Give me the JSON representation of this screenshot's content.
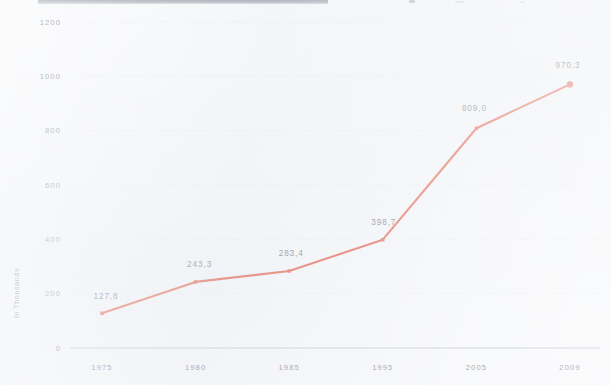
{
  "page": {
    "background_color": "#f6f7f9",
    "clipped_header_bar": {
      "present": true,
      "color": "#8d939b",
      "note": ""
    }
  },
  "chart_data": {
    "type": "line",
    "title": "",
    "subtitle": "",
    "xlabel": "",
    "ylabel": "in Thousands",
    "categories": [
      "1975",
      "1980",
      "1985",
      "1995",
      "2005",
      "2009"
    ],
    "x": [
      "1975",
      "1980",
      "1985",
      "1995",
      "2005",
      "2009"
    ],
    "values": [
      127.8,
      243.3,
      283.4,
      398.7,
      809.0,
      970.3
    ],
    "point_labels": [
      "127,8",
      "243,3",
      "283,4",
      "398,7",
      "809,0",
      "970,3"
    ],
    "series": [
      {
        "name": "",
        "color": "#e0391c",
        "values": [
          127.8,
          243.3,
          283.4,
          398.7,
          809.0,
          970.3
        ],
        "marker": "square",
        "last_marker": "circle"
      }
    ],
    "ylim": [
      0,
      1200
    ],
    "yticks": [
      0,
      200,
      400,
      600,
      800,
      1000,
      1200
    ],
    "ytick_labels": [
      "0",
      "200",
      "400",
      "600",
      "800",
      "1000",
      "1200"
    ],
    "xtick_labels": [
      "1975",
      "1980",
      "1985",
      "1995",
      "2005",
      "2009"
    ],
    "grid": true,
    "grid_style": "dotted-horizontal",
    "grid_color": "#d5dae1",
    "legend": false,
    "legend_position": "none",
    "decimal_separator": ",",
    "annotations": []
  },
  "colors": {
    "line": "#e0391c",
    "marker": "#e0391c",
    "grid": "#d5dae1",
    "axis": "#b7bcc4",
    "tick_text": "#6f7680",
    "label_text": "#4e535b",
    "background": "#f6f7f9"
  }
}
